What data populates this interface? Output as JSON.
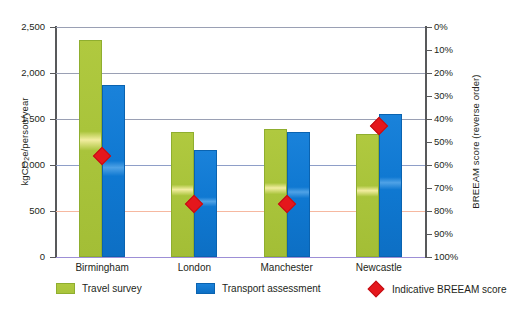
{
  "chart_data": {
    "type": "bar",
    "title": "",
    "categories": [
      "Birmingham",
      "London",
      "Manchester",
      "Newcastle"
    ],
    "series": [
      {
        "name": "Travel survey",
        "axis": "left",
        "color": "#a9c43b",
        "values": [
          2360,
          1360,
          1390,
          1335
        ]
      },
      {
        "name": "Transport assessment",
        "axis": "left",
        "color": "#1079d2",
        "values": [
          1870,
          1160,
          1360,
          1555
        ]
      },
      {
        "name": "Indicative BREEAM score",
        "axis": "right",
        "color": "#e5171c",
        "type": "scatter",
        "marker": "diamond",
        "values": [
          56,
          77,
          77,
          43
        ]
      }
    ],
    "xlabel": "",
    "ylabel": "kgCO2e/person/year",
    "ylabel_html": "kgCO<sub>2</sub>e/person/year",
    "ylim": [
      0,
      2500
    ],
    "yticks": [
      0,
      500,
      1000,
      1500,
      2000,
      2500
    ],
    "yticklabels": [
      "0",
      "500",
      "1,000",
      "1,500",
      "2,000",
      "2,500"
    ],
    "y2label": "BREEAM score (reverse order)",
    "y2lim": [
      0,
      100
    ],
    "y2_reversed": true,
    "y2ticks": [
      0,
      10,
      20,
      30,
      40,
      50,
      60,
      70,
      80,
      90,
      100
    ],
    "y2ticklabels": [
      "0%",
      "10%",
      "20%",
      "30%",
      "40%",
      "50%",
      "60%",
      "70%",
      "80%",
      "90%",
      "100%"
    ],
    "grid": true,
    "legend_position": "bottom"
  },
  "legend": {
    "items": [
      {
        "label": "Travel survey",
        "swatch": "green"
      },
      {
        "label": "Transport assessment",
        "swatch": "blue"
      },
      {
        "label": "Indicative BREEAM score",
        "swatch": "diamond"
      }
    ]
  }
}
